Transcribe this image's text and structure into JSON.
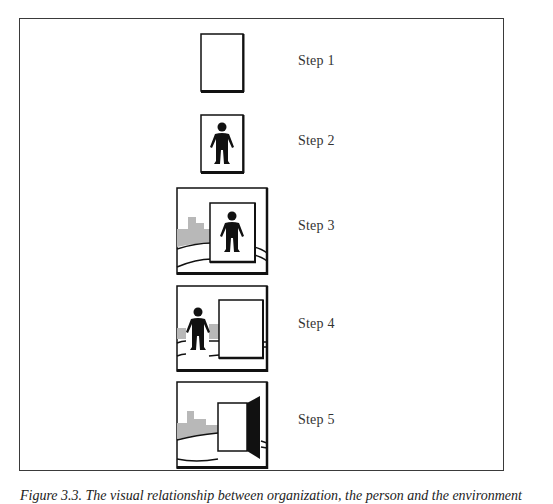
{
  "figure": {
    "steps": [
      {
        "label": "Step 1",
        "content": "empty-frame"
      },
      {
        "label": "Step 2",
        "content": "person-in-frame"
      },
      {
        "label": "Step 3",
        "content": "person-frame-over-landscape"
      },
      {
        "label": "Step 4",
        "content": "person-beside-blank-frame-in-landscape"
      },
      {
        "label": "Step 5",
        "content": "open-door-in-landscape"
      }
    ],
    "caption": "Figure 3.3. The visual relationship between organization, the person and the environment"
  },
  "colors": {
    "stroke": "#111111",
    "frame_border": "#3a3a3a",
    "city_fill": "#b8b8b8",
    "background": "#ffffff"
  }
}
